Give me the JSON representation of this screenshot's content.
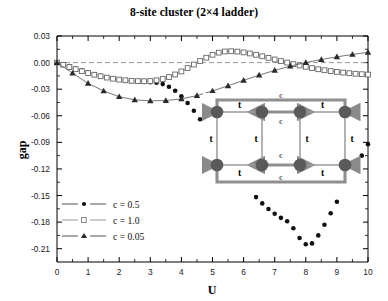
{
  "chart_data": {
    "type": "line",
    "title": "8-site cluster (2×4 ladder)",
    "xlabel": "U",
    "ylabel": "gap",
    "xlim": [
      0,
      10
    ],
    "ylim": [
      -0.225,
      0.03
    ],
    "grid": false,
    "zero_line": true,
    "xticks": [
      0,
      1,
      2,
      3,
      4,
      5,
      6,
      7,
      8,
      9,
      10
    ],
    "yticks": [
      0.03,
      0.0,
      -0.03,
      -0.06,
      -0.09,
      -0.12,
      -0.15,
      -0.18,
      -0.21
    ],
    "ytick_labels": [
      "0.03",
      "0.00",
      "-0.03",
      "-0.06",
      "-0.09",
      "-0.12",
      "-0.15",
      "-0.18",
      "-0.21"
    ],
    "xtick_labels": [
      "0",
      "1",
      "2",
      "3",
      "4",
      "5",
      "6",
      "7",
      "8",
      "9",
      "10"
    ],
    "minor_ticks_per_interval": 2,
    "legend_position": "lower-left",
    "series": [
      {
        "name": "c = 0.5",
        "marker": "filled-circle",
        "color": "#111111",
        "x": [
          0,
          0.2,
          0.4,
          0.6,
          0.8,
          1.0,
          1.2,
          1.4,
          1.6,
          1.8,
          2.0,
          2.2,
          2.4,
          2.6,
          2.8,
          3.0,
          3.2,
          3.4,
          3.6,
          3.8,
          4.0,
          4.2,
          4.4,
          4.6,
          4.8,
          5.0,
          5.2,
          5.4,
          5.6,
          5.8,
          6.0,
          6.2,
          6.4,
          6.6,
          6.8,
          7.0,
          7.2,
          7.4,
          7.6,
          7.8,
          8.0,
          8.2,
          8.4,
          8.6,
          8.8,
          9.0,
          9.2,
          9.4,
          9.6,
          9.8,
          10.0
        ],
        "y": [
          0.0,
          -0.0022,
          -0.0044,
          -0.0066,
          -0.0088,
          -0.011,
          -0.0131,
          -0.015,
          -0.0167,
          -0.0182,
          -0.0194,
          -0.0203,
          -0.021,
          -0.0215,
          -0.0219,
          -0.0222,
          -0.0228,
          -0.0243,
          -0.0272,
          -0.0318,
          -0.038,
          -0.0456,
          -0.0543,
          -0.0639,
          -0.074,
          -0.0845,
          -0.0951,
          -0.1057,
          -0.116,
          -0.1259,
          -0.1352,
          -0.1439,
          -0.1518,
          -0.1589,
          -0.1652,
          -0.1706,
          -0.1752,
          -0.179,
          -0.187,
          -0.198,
          -0.205,
          -0.204,
          -0.195,
          -0.183,
          -0.17,
          -0.157,
          -0.144,
          -0.131,
          -0.118,
          -0.105,
          -0.092
        ]
      },
      {
        "name": "c = 1.0",
        "marker": "open-square",
        "color": "#3a3a3a",
        "x": [
          0,
          0.2,
          0.4,
          0.6,
          0.8,
          1.0,
          1.2,
          1.4,
          1.6,
          1.8,
          2.0,
          2.2,
          2.4,
          2.6,
          2.8,
          3.0,
          3.2,
          3.4,
          3.6,
          3.8,
          4.0,
          4.2,
          4.4,
          4.6,
          4.8,
          5.0,
          5.2,
          5.4,
          5.6,
          5.8,
          6.0,
          6.2,
          6.4,
          6.6,
          6.8,
          7.0,
          7.2,
          7.4,
          7.6,
          7.8,
          8.0,
          8.2,
          8.4,
          8.6,
          8.8,
          9.0,
          9.2,
          9.4,
          9.6,
          9.8,
          10.0
        ],
        "y": [
          0.0,
          -0.0025,
          -0.005,
          -0.0074,
          -0.0097,
          -0.0118,
          -0.0137,
          -0.0154,
          -0.0169,
          -0.0182,
          -0.0192,
          -0.02,
          -0.0206,
          -0.0209,
          -0.021,
          -0.0208,
          -0.02,
          -0.0185,
          -0.0163,
          -0.0134,
          -0.01,
          -0.0062,
          -0.0022,
          0.0018,
          0.0055,
          0.0088,
          0.0112,
          0.0125,
          0.0128,
          0.0124,
          0.0115,
          0.0103,
          0.0088,
          0.0071,
          0.0053,
          0.0035,
          0.0017,
          0.0,
          -0.0017,
          -0.0033,
          -0.0048,
          -0.0062,
          -0.0075,
          -0.0086,
          -0.0096,
          -0.0105,
          -0.0113,
          -0.012,
          -0.0126,
          -0.0131,
          -0.0135
        ]
      },
      {
        "name": "c = 0.05",
        "marker": "filled-triangle",
        "color": "#2a2a2a",
        "x": [
          0,
          0.5,
          1.0,
          1.5,
          2.0,
          2.5,
          3.0,
          3.5,
          4.0,
          4.5,
          5.0,
          5.5,
          6.0,
          6.5,
          7.0,
          7.5,
          8.0,
          8.5,
          9.0,
          9.5,
          10.0
        ],
        "y": [
          0.0,
          -0.012,
          -0.0235,
          -0.032,
          -0.0385,
          -0.042,
          -0.0432,
          -0.0428,
          -0.041,
          -0.0372,
          -0.032,
          -0.0262,
          -0.02,
          -0.0142,
          -0.0088,
          -0.004,
          0.0,
          0.0035,
          0.0065,
          0.0092,
          0.0115
        ]
      }
    ],
    "inset": {
      "caption": "2x4 ladder lattice with periodic c-bonds",
      "hopping_label": "t",
      "coupling_label": "c",
      "site_count": 8,
      "rows": 2,
      "cols": 4,
      "t_labels": [
        "t",
        "t",
        "t",
        "t",
        "t",
        "t",
        "t",
        "t",
        "t",
        "t"
      ],
      "c_labels": [
        "c",
        "c",
        "c",
        "c"
      ]
    }
  }
}
